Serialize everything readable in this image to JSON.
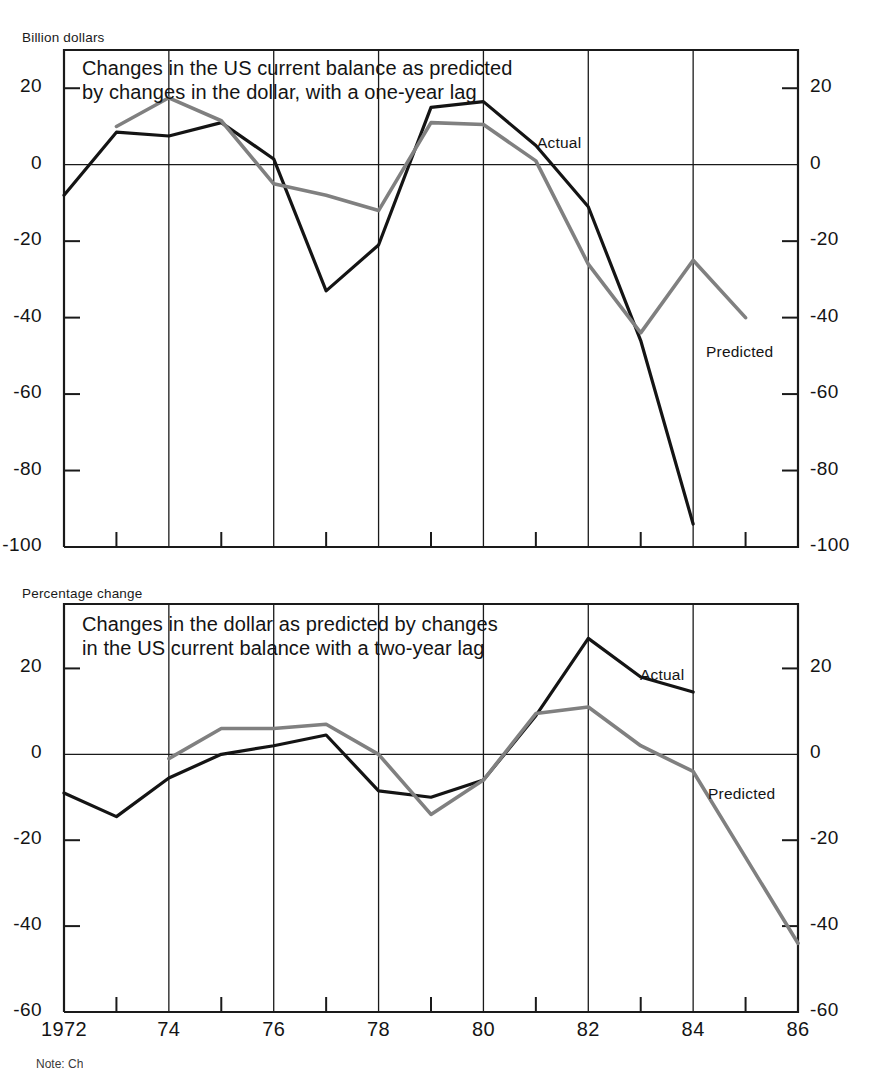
{
  "figure": {
    "background": "#ffffff",
    "actual_color": "#141414",
    "predicted_color": "#808080",
    "axis_color": "#1a1a1a"
  },
  "panel_top": {
    "unit_label": "Billion dollars",
    "title": "Changes in the US current balance as predicted\nby changes in the dollar, with a one-year lag",
    "actual_label": "Actual",
    "predicted_label": "Predicted",
    "y_ticks_left": [
      "20",
      "0",
      "-20",
      "-40",
      "-60",
      "-80",
      "-100"
    ],
    "y_ticks_right": [
      "20",
      "0",
      "-20",
      "-40",
      "-60",
      "-80",
      "-100"
    ]
  },
  "panel_bottom": {
    "unit_label": "Percentage change",
    "title": "Changes in the dollar as predicted by changes\nin the US current balance with a two-year lag",
    "actual_label": "Actual",
    "predicted_label": "Predicted",
    "y_ticks_left": [
      "20",
      "0",
      "-20",
      "-40",
      "-60"
    ],
    "y_ticks_right": [
      "20",
      "0",
      "-20",
      "-40",
      "-60"
    ]
  },
  "x_axis": {
    "tick_labels": [
      "1972",
      "",
      "74",
      "",
      "76",
      "",
      "78",
      "",
      "80",
      "",
      "82",
      "",
      "84",
      "",
      "86"
    ],
    "tick_years": [
      1972,
      1973,
      1974,
      1975,
      1976,
      1977,
      1978,
      1979,
      1980,
      1981,
      1982,
      1983,
      1984,
      1985,
      1986
    ],
    "gridline_years": [
      1974,
      1976,
      1978,
      1980,
      1982,
      1984
    ]
  },
  "footnote": "Note: Ch",
  "chart_data": [
    {
      "type": "line",
      "title": "Changes in the US current balance as predicted by changes in the dollar, with a one-year lag",
      "xlabel": "",
      "ylabel": "Billion dollars",
      "xlim": [
        1972,
        1986
      ],
      "ylim": [
        -100,
        30
      ],
      "yticks": [
        20,
        0,
        -20,
        -40,
        -60,
        -80,
        -100
      ],
      "grid": "vertical-at-even-years",
      "legend": "inline-annotations",
      "series": [
        {
          "name": "Actual",
          "color": "#141414",
          "x": [
            1972,
            1973,
            1974,
            1975,
            1976,
            1977,
            1978,
            1979,
            1980,
            1981,
            1982,
            1983,
            1984
          ],
          "values": [
            -8,
            8.5,
            7.5,
            11,
            1.5,
            -33,
            -21,
            15,
            16.5,
            5,
            -11,
            -46,
            -94
          ]
        },
        {
          "name": "Predicted",
          "color": "#808080",
          "x": [
            1973,
            1974,
            1975,
            1976,
            1977,
            1978,
            1979,
            1980,
            1981,
            1982,
            1983,
            1984,
            1985
          ],
          "values": [
            10,
            17.5,
            11.5,
            -5,
            -8,
            -12,
            11,
            10.5,
            1,
            -26,
            -44,
            -25,
            -40
          ]
        }
      ]
    },
    {
      "type": "line",
      "title": "Changes in the dollar as predicted by changes in the US current balance with a two-year lag",
      "xlabel": "",
      "ylabel": "Percentage change",
      "xlim": [
        1972,
        1986
      ],
      "ylim": [
        -60,
        35
      ],
      "yticks": [
        20,
        0,
        -20,
        -40,
        -60
      ],
      "grid": "vertical-at-even-years",
      "legend": "inline-annotations",
      "series": [
        {
          "name": "Actual",
          "color": "#141414",
          "x": [
            1972,
            1973,
            1974,
            1975,
            1976,
            1977,
            1978,
            1979,
            1980,
            1981,
            1982,
            1983,
            1984
          ],
          "values": [
            -9,
            -14.5,
            -5.5,
            0,
            2,
            4.5,
            -8.5,
            -10,
            -6,
            9,
            27,
            18,
            14.5
          ]
        },
        {
          "name": "Predicted",
          "color": "#808080",
          "x": [
            1974,
            1975,
            1976,
            1977,
            1978,
            1979,
            1980,
            1981,
            1982,
            1983,
            1984,
            1985,
            1986
          ],
          "values": [
            -1,
            6,
            6,
            7,
            0,
            -14,
            -6,
            9.5,
            11,
            2,
            -4,
            -24,
            -44
          ]
        }
      ]
    }
  ]
}
